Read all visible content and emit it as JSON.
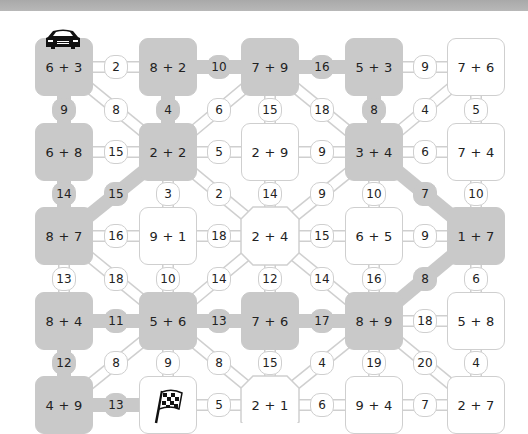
{
  "game": {
    "type": "addition maze path puzzle",
    "start_icon": "race-car-icon",
    "finish_icon": "checkered-flag-icon",
    "colors": {
      "path_gray": "#c9c9c9",
      "node_white": "#ffffff",
      "outline": "#cfcfcf",
      "top_bar": "#b0b0b0"
    }
  },
  "nodes": {
    "r0c0": {
      "label": "6 + 3",
      "style": "gray"
    },
    "r0c1": {
      "label": "8 + 2",
      "style": "gray"
    },
    "r0c2": {
      "label": "7 + 9",
      "style": "gray"
    },
    "r0c3": {
      "label": "5 + 3",
      "style": "gray"
    },
    "r0c4": {
      "label": "7 + 6",
      "style": "white"
    },
    "r1c0": {
      "label": "6 + 8",
      "style": "gray"
    },
    "r1c1": {
      "label": "2 + 2",
      "style": "gray"
    },
    "r1c2": {
      "label": "2 + 9",
      "style": "white"
    },
    "r1c3": {
      "label": "3 + 4",
      "style": "gray"
    },
    "r1c4": {
      "label": "7 + 4",
      "style": "white"
    },
    "r2c0": {
      "label": "8 + 7",
      "style": "gray"
    },
    "r2c1": {
      "label": "9 + 1",
      "style": "white"
    },
    "r2c2": {
      "label": "2 + 4",
      "style": "white"
    },
    "r2c3": {
      "label": "6 + 5",
      "style": "white"
    },
    "r2c4": {
      "label": "1 + 7",
      "style": "gray"
    },
    "r3c0": {
      "label": "8 + 4",
      "style": "gray"
    },
    "r3c1": {
      "label": "5 + 6",
      "style": "gray"
    },
    "r3c2": {
      "label": "7 + 6",
      "style": "gray"
    },
    "r3c3": {
      "label": "8 + 9",
      "style": "gray"
    },
    "r3c4": {
      "label": "5 + 8",
      "style": "white"
    },
    "r4c0": {
      "label": "4 + 9",
      "style": "gray"
    },
    "r4c1": {
      "label": "",
      "style": "white",
      "icon": "checkered-flag-icon"
    },
    "r4c2": {
      "label": "2 + 1",
      "style": "white"
    },
    "r4c3": {
      "label": "9 + 4",
      "style": "white"
    },
    "r4c4": {
      "label": "2 + 7",
      "style": "white"
    }
  },
  "edges": [
    {
      "from": "r0c0",
      "to": "r0c1",
      "value": "2",
      "style": "white"
    },
    {
      "from": "r0c1",
      "to": "r0c2",
      "value": "10",
      "style": "gray"
    },
    {
      "from": "r0c2",
      "to": "r0c3",
      "value": "16",
      "style": "gray"
    },
    {
      "from": "r0c3",
      "to": "r0c4",
      "value": "9",
      "style": "white"
    },
    {
      "from": "r0c0",
      "to": "r1c0",
      "value": "9",
      "style": "gray"
    },
    {
      "from": "r0c0",
      "to": "r1c1",
      "value": "8",
      "style": "white"
    },
    {
      "from": "r0c1",
      "to": "r1c1",
      "value": "4",
      "style": "gray"
    },
    {
      "from": "r0c2",
      "to": "r1c1",
      "value": "6",
      "style": "white"
    },
    {
      "from": "r0c2",
      "to": "r1c2",
      "value": "15",
      "style": "white"
    },
    {
      "from": "r0c2",
      "to": "r1c3",
      "value": "18",
      "style": "white"
    },
    {
      "from": "r0c3",
      "to": "r1c3",
      "value": "8",
      "style": "gray"
    },
    {
      "from": "r0c4",
      "to": "r1c3",
      "value": "4",
      "style": "white"
    },
    {
      "from": "r0c4",
      "to": "r1c4",
      "value": "5",
      "style": "white"
    },
    {
      "from": "r1c0",
      "to": "r1c1",
      "value": "15",
      "style": "white"
    },
    {
      "from": "r1c1",
      "to": "r1c2",
      "value": "5",
      "style": "white"
    },
    {
      "from": "r1c2",
      "to": "r1c3",
      "value": "9",
      "style": "white"
    },
    {
      "from": "r1c3",
      "to": "r1c4",
      "value": "6",
      "style": "white"
    },
    {
      "from": "r1c0",
      "to": "r2c0",
      "value": "14",
      "style": "gray"
    },
    {
      "from": "r1c1",
      "to": "r2c0",
      "value": "15",
      "style": "gray"
    },
    {
      "from": "r1c1",
      "to": "r2c1",
      "value": "3",
      "style": "white"
    },
    {
      "from": "r1c1",
      "to": "r2c2",
      "value": "2",
      "style": "white"
    },
    {
      "from": "r1c2",
      "to": "r2c2",
      "value": "14",
      "style": "white"
    },
    {
      "from": "r1c3",
      "to": "r2c2",
      "value": "9",
      "style": "white"
    },
    {
      "from": "r1c3",
      "to": "r2c3",
      "value": "10",
      "style": "white"
    },
    {
      "from": "r1c3",
      "to": "r2c4",
      "value": "7",
      "style": "gray"
    },
    {
      "from": "r1c4",
      "to": "r2c4",
      "value": "10",
      "style": "white"
    },
    {
      "from": "r2c0",
      "to": "r2c1",
      "value": "16",
      "style": "white"
    },
    {
      "from": "r2c1",
      "to": "r2c2",
      "value": "18",
      "style": "white"
    },
    {
      "from": "r2c2",
      "to": "r2c3",
      "value": "15",
      "style": "white"
    },
    {
      "from": "r2c3",
      "to": "r2c4",
      "value": "9",
      "style": "white"
    },
    {
      "from": "r2c0",
      "to": "r3c0",
      "value": "13",
      "style": "white"
    },
    {
      "from": "r2c0",
      "to": "r3c1",
      "value": "18",
      "style": "white"
    },
    {
      "from": "r2c1",
      "to": "r3c1",
      "value": "10",
      "style": "white"
    },
    {
      "from": "r2c2",
      "to": "r3c1",
      "value": "14",
      "style": "white"
    },
    {
      "from": "r2c2",
      "to": "r3c2",
      "value": "12",
      "style": "white"
    },
    {
      "from": "r2c2",
      "to": "r3c3",
      "value": "14",
      "style": "white"
    },
    {
      "from": "r2c3",
      "to": "r3c3",
      "value": "16",
      "style": "white"
    },
    {
      "from": "r2c4",
      "to": "r3c3",
      "value": "8",
      "style": "gray"
    },
    {
      "from": "r2c4",
      "to": "r3c4",
      "value": "6",
      "style": "white"
    },
    {
      "from": "r3c0",
      "to": "r3c1",
      "value": "11",
      "style": "gray"
    },
    {
      "from": "r3c1",
      "to": "r3c2",
      "value": "13",
      "style": "gray"
    },
    {
      "from": "r3c2",
      "to": "r3c3",
      "value": "17",
      "style": "gray"
    },
    {
      "from": "r3c3",
      "to": "r3c4",
      "value": "18",
      "style": "white"
    },
    {
      "from": "r3c0",
      "to": "r4c0",
      "value": "12",
      "style": "gray"
    },
    {
      "from": "r3c1",
      "to": "r4c0",
      "value": "8",
      "style": "white"
    },
    {
      "from": "r3c1",
      "to": "r4c1",
      "value": "9",
      "style": "white"
    },
    {
      "from": "r3c1",
      "to": "r4c2",
      "value": "8",
      "style": "white"
    },
    {
      "from": "r3c2",
      "to": "r4c2",
      "value": "15",
      "style": "white"
    },
    {
      "from": "r3c3",
      "to": "r4c2",
      "value": "4",
      "style": "white"
    },
    {
      "from": "r3c3",
      "to": "r4c3",
      "value": "19",
      "style": "white"
    },
    {
      "from": "r3c3",
      "to": "r4c4",
      "value": "20",
      "style": "white"
    },
    {
      "from": "r3c4",
      "to": "r4c4",
      "value": "4",
      "style": "white"
    },
    {
      "from": "r4c0",
      "to": "r4c1",
      "value": "13",
      "style": "gray"
    },
    {
      "from": "r4c1",
      "to": "r4c2",
      "value": "5",
      "style": "white"
    },
    {
      "from": "r4c2",
      "to": "r4c3",
      "value": "6",
      "style": "white"
    },
    {
      "from": "r4c3",
      "to": "r4c4",
      "value": "7",
      "style": "white"
    }
  ]
}
